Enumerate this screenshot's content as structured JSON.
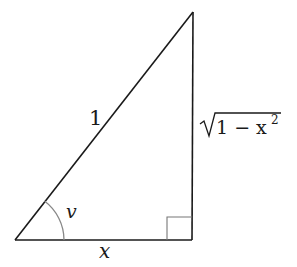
{
  "diagram": {
    "type": "right-triangle",
    "hypotenuse_label": "1",
    "vertical_leg_label_radicand": "1 − x",
    "vertical_leg_label_exponent": "2",
    "horizontal_leg_label": "x",
    "angle_label": "v",
    "colors": {
      "lines": "#1a1a1a",
      "arc": "#888888",
      "right_angle_marker": "#777777"
    }
  }
}
